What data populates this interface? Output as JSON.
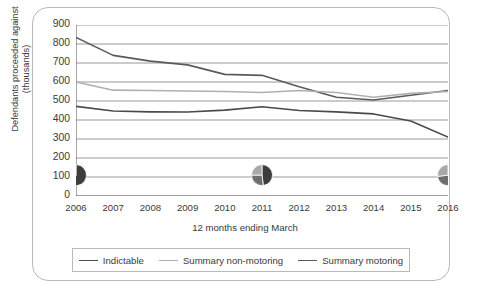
{
  "axes": {
    "y_title": "Defendants proceeded against (thousands)",
    "x_title": "12 months ending March",
    "y_ticks": [
      "900",
      "800",
      "700",
      "600",
      "500",
      "400",
      "300",
      "200",
      "100",
      "0"
    ],
    "x_ticks": [
      "2006",
      "2007",
      "2008",
      "2009",
      "2010",
      "2011",
      "2012",
      "2013",
      "2014",
      "2015",
      "2016"
    ]
  },
  "legend": {
    "items": [
      {
        "label": "Indictable",
        "color": "#4a4a4a"
      },
      {
        "label": "Summary non-motoring",
        "color": "#b0b0b0"
      },
      {
        "label": "Summary motoring",
        "color": "#5a5a5a"
      }
    ]
  },
  "colors": {
    "grid": "#8c8c8c",
    "axis": "#6e6e6e",
    "border": "#b9b9b9",
    "pie_dark": "#3d3d3d",
    "pie_mid": "#6f6f6f",
    "pie_light": "#a8a8a8"
  },
  "chart_data": {
    "type": "line",
    "title": "",
    "xlabel": "12 months ending March",
    "ylabel": "Defendants proceeded against (thousands)",
    "categories": [
      "2006",
      "2007",
      "2008",
      "2009",
      "2010",
      "2011",
      "2012",
      "2013",
      "2014",
      "2015",
      "2016"
    ],
    "ylim": [
      0,
      900
    ],
    "grid": true,
    "legend_position": "bottom",
    "series": [
      {
        "name": "Summary motoring",
        "color": "#5a5a5a",
        "values": [
          835,
          740,
          710,
          690,
          640,
          635,
          575,
          520,
          505,
          530,
          555
        ]
      },
      {
        "name": "Summary non-motoring",
        "color": "#b0b0b0",
        "values": [
          600,
          557,
          555,
          553,
          550,
          545,
          555,
          545,
          520,
          540,
          550
        ]
      },
      {
        "name": "Indictable",
        "color": "#4a4a4a",
        "values": [
          472,
          447,
          443,
          442,
          452,
          470,
          450,
          443,
          432,
          395,
          310
        ]
      }
    ],
    "pie_markers": [
      {
        "at": "2006",
        "value": 110,
        "slices": [
          55,
          25,
          20
        ]
      },
      {
        "at": "2011",
        "value": 110,
        "slices": [
          48,
          27,
          25
        ]
      },
      {
        "at": "2016",
        "value": 110,
        "slices": [
          45,
          28,
          27
        ]
      }
    ]
  }
}
